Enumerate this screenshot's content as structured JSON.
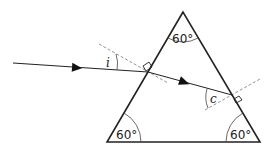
{
  "diagram": {
    "type": "prism-refraction",
    "angles": {
      "apex": "60°",
      "bottom_left": "60°",
      "bottom_right": "60°"
    },
    "labels": {
      "incidence_angle": "i",
      "critical_angle": "c"
    },
    "colors": {
      "line": "#222222",
      "normal": "#666666",
      "background": "#ffffff"
    }
  }
}
